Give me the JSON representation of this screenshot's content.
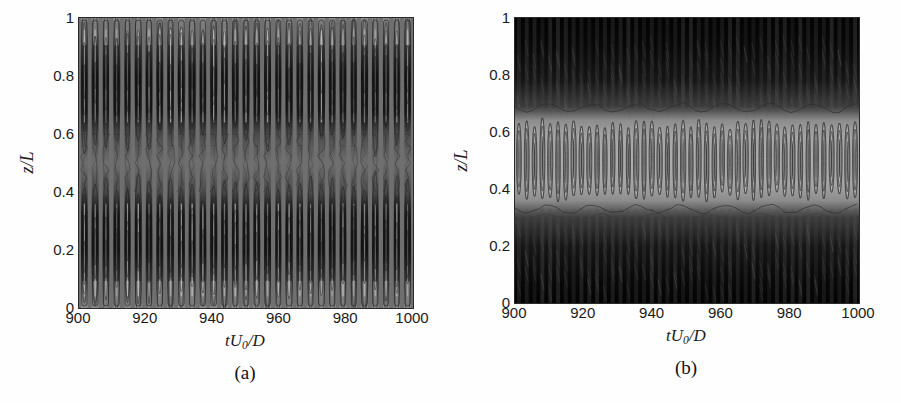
{
  "figure": {
    "panels": [
      {
        "caption": "(a)",
        "xlabel_prefix": "tU",
        "xlabel_sub": "0",
        "xlabel_suffix": "/D",
        "ylabel": "z/L",
        "xticks": [
          "900",
          "920",
          "940",
          "960",
          "980",
          "1000"
        ],
        "yticks": [
          "1",
          "0.8",
          "0.6",
          "0.4",
          "0.2",
          "0"
        ]
      },
      {
        "caption": "(b)",
        "xlabel_prefix": "tU",
        "xlabel_sub": "0",
        "xlabel_suffix": "/D",
        "ylabel": "z/L",
        "xticks": [
          "900",
          "920",
          "940",
          "960",
          "980",
          "1000"
        ],
        "yticks": [
          "1",
          "0.8",
          "0.6",
          "0.4",
          "0.2",
          "0"
        ]
      }
    ]
  },
  "chart_data": [
    {
      "type": "heatmap",
      "title": "(a)",
      "xlabel": "tU0/D",
      "ylabel": "z/L",
      "xlim": [
        900,
        1000
      ],
      "ylim": [
        0,
        1
      ],
      "xticks": [
        900,
        920,
        940,
        960,
        980,
        1000
      ],
      "yticks": [
        0,
        0.2,
        0.4,
        0.6,
        0.8,
        1
      ],
      "grid": false,
      "legend": false,
      "colormap": "grayscale",
      "description": "Space-time contour map of spanwise vibration response along the cylinder span. Strong vertically striped standing-wave pattern with uniform mid-gray background, dark (high amplitude) lobes concentrated in two bands centred near z/L = 0.2 and z/L = 0.8, with a lower-amplitude mixed region near the mid-span z/L = 0.5. Roughly 31 temporal cycles across the 100 time-unit window, i.e. a dominant period of about 3.2 tU0/D.",
      "n_time_cycles": 31,
      "dominant_period": 3.2,
      "mode_shape": "second-mode standing wave (two antinodes near z/L = 0.2 and 0.8, node near z/L = 0.5)",
      "antinode_positions": [
        0.2,
        0.8
      ],
      "node_positions": [
        0.5
      ],
      "background_level": 0.5,
      "contour_levels": [
        -1.0,
        -0.75,
        -0.5,
        -0.25,
        0,
        0.25,
        0.5,
        0.75,
        1.0
      ]
    },
    {
      "type": "heatmap",
      "title": "(b)",
      "xlabel": "tU0/D",
      "ylabel": "z/L",
      "xlim": [
        900,
        1000
      ],
      "ylim": [
        0,
        1
      ],
      "xticks": [
        900,
        920,
        940,
        960,
        980,
        1000
      ],
      "yticks": [
        0,
        0.2,
        0.4,
        0.6,
        0.8,
        1
      ],
      "grid": false,
      "legend": false,
      "colormap": "grayscale",
      "description": "Space-time contour map with a very dark (large magnitude) field over the upper (z/L > 0.68) and lower (z/L < 0.33) spans and a bright light-gray band across the mid-span 0.35 < z/L < 0.65 containing a regular train of elongated vertical ellipses. Approximately 44 temporal cycles across the 100 time-unit window, i.e. a dominant period of about 2.3 tU0/D.",
      "n_time_cycles": 44,
      "dominant_period": 2.3,
      "mode_shape": "first-mode standing wave (single antinode at mid-span z/L = 0.5)",
      "antinode_positions": [
        0.5
      ],
      "node_positions": [
        0.33,
        0.68
      ],
      "background_level": 0.0,
      "contour_levels": [
        -1.0,
        -0.75,
        -0.5,
        -0.25,
        0,
        0.25,
        0.5,
        0.75,
        1.0
      ]
    }
  ]
}
